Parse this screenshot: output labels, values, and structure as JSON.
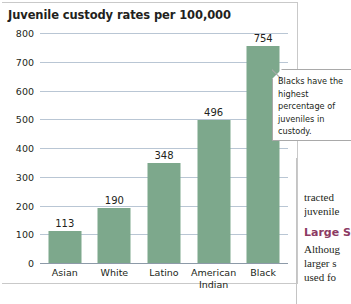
{
  "chart_data": {
    "type": "bar",
    "title": "Juvenile custody rates per 100,000",
    "xlabel": "",
    "ylabel": "",
    "ylim": [
      0,
      800
    ],
    "yticks": [
      0,
      100,
      200,
      300,
      400,
      500,
      600,
      700,
      800
    ],
    "grid": true,
    "legend": "none",
    "categories": [
      "Asian",
      "White",
      "Latino",
      "American Indian",
      "Black"
    ],
    "values": [
      113,
      190,
      348,
      496,
      754
    ],
    "bar_color": "#7da88c",
    "gridline_color": "#b9c6d4",
    "annotations": [
      {
        "target_category": "Black",
        "text": "Blacks have the highest percentage of juveniles in custody."
      }
    ]
  },
  "figure": {
    "title": "Juvenile custody rates per 100,000",
    "y_tick_labels": [
      "800",
      "700",
      "600",
      "500",
      "400",
      "300",
      "200",
      "100",
      "0"
    ],
    "category_labels": [
      "Asian",
      "White",
      "Latino",
      "American\nIndian",
      "Black"
    ],
    "value_labels": [
      "113",
      "190",
      "348",
      "496",
      "754"
    ]
  },
  "callout": {
    "text": "Blacks have the highest percentage of juveniles in custody."
  },
  "right_column": {
    "lines": [
      "tracted",
      "juvenile"
    ],
    "heading": "Large S",
    "body_lines": [
      "Althoug",
      "larger s",
      "used fo"
    ],
    "heading_color": "#8c3a63"
  }
}
